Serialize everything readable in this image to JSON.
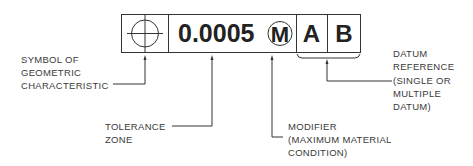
{
  "frame": {
    "symbol": "position-icon",
    "tolerance_value": "0.0005",
    "modifier": "M",
    "datums": [
      "A",
      "B"
    ]
  },
  "callouts": {
    "symbol": [
      "SYMBOL OF",
      "GEOMETRIC",
      "CHARACTERISTIC"
    ],
    "tolerance": [
      "TOLERANCE",
      "ZONE"
    ],
    "modifier": [
      "MODIFIER",
      "(MAXIMUM MATERIAL",
      "CONDITION)"
    ],
    "datum": [
      "DATUM",
      "REFERENCE",
      "(SINGLE OR",
      "MULTIPLE",
      "DATUM)"
    ]
  },
  "colors": {
    "line": "#333333",
    "text": "#3a3a3a",
    "background": "#ffffff"
  }
}
